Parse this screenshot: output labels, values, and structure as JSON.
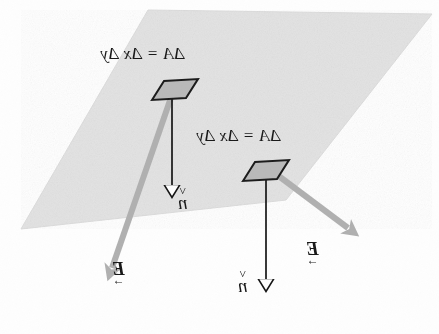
{
  "figure": {
    "kind": "physics-diagram",
    "orientation_note": "All text in the source image is rendered mirror-reversed (flipped horizontally).",
    "background_color": "#fefefe"
  },
  "plane": {
    "name": "flat surface",
    "fill_color": "#e2e2e2",
    "edge_color": "#d2d2d2",
    "points": "148,10 432,14 286,200 21,229"
  },
  "patches": [
    {
      "id": "patch-1",
      "fill_color": "#b9b9b9",
      "edge_color": "#1a1a1a",
      "points": "152,99 163,82 197,79 186,97",
      "label": "ΔA = Δx Δy",
      "label_x": 100,
      "label_y": 47
    },
    {
      "id": "patch-2",
      "fill_color": "#b9b9b9",
      "edge_color": "#1a1a1a",
      "points": "243,180 254,163 288,160 277,178",
      "label": "ΔA = Δx Δy",
      "label_x": 196,
      "label_y": 128
    }
  ],
  "labels": {
    "delta_area_1": "ΔA = Δx Δy",
    "delta_area_2": "ΔA = Δx Δy",
    "normal_1": "n",
    "normal_1_accent": "^",
    "normal_2": "n",
    "normal_2_accent": "^",
    "efield_1": "E",
    "efield_1_accent": "→",
    "efield_2": "E",
    "efield_2_accent": "→"
  },
  "vectors": {
    "normals": [
      {
        "id": "normal-arrow-1",
        "name": "unit normal n-hat (upper patch)",
        "color": "#141414",
        "x1": 172,
        "y1": 90,
        "x2": 172,
        "y2": 196,
        "label_x": 181,
        "label_y": 192
      },
      {
        "id": "normal-arrow-2",
        "name": "unit normal n-hat (lower patch)",
        "color": "#141414",
        "x1": 266,
        "y1": 170,
        "x2": 266,
        "y2": 290,
        "label_x": 238,
        "label_y": 275
      }
    ],
    "efields": [
      {
        "id": "efield-arrow-1",
        "name": "electric field E (upper patch)",
        "color": "#b0b0b0",
        "x1": 175,
        "y1": 86,
        "x2": 110,
        "y2": 275,
        "label_x": 113,
        "label_y": 263
      },
      {
        "id": "efield-arrow-2",
        "name": "electric field E (lower patch)",
        "color": "#b0b0b0",
        "x1": 268,
        "y1": 168,
        "x2": 355,
        "y2": 233,
        "label_x": 307,
        "label_y": 243
      }
    ]
  },
  "colors": {
    "ink": "#171717",
    "plane_gray": "#e2e2e2",
    "patch_gray": "#b9b9b9",
    "arrow_gray": "#b0b0b0",
    "paper": "#fefefe"
  }
}
